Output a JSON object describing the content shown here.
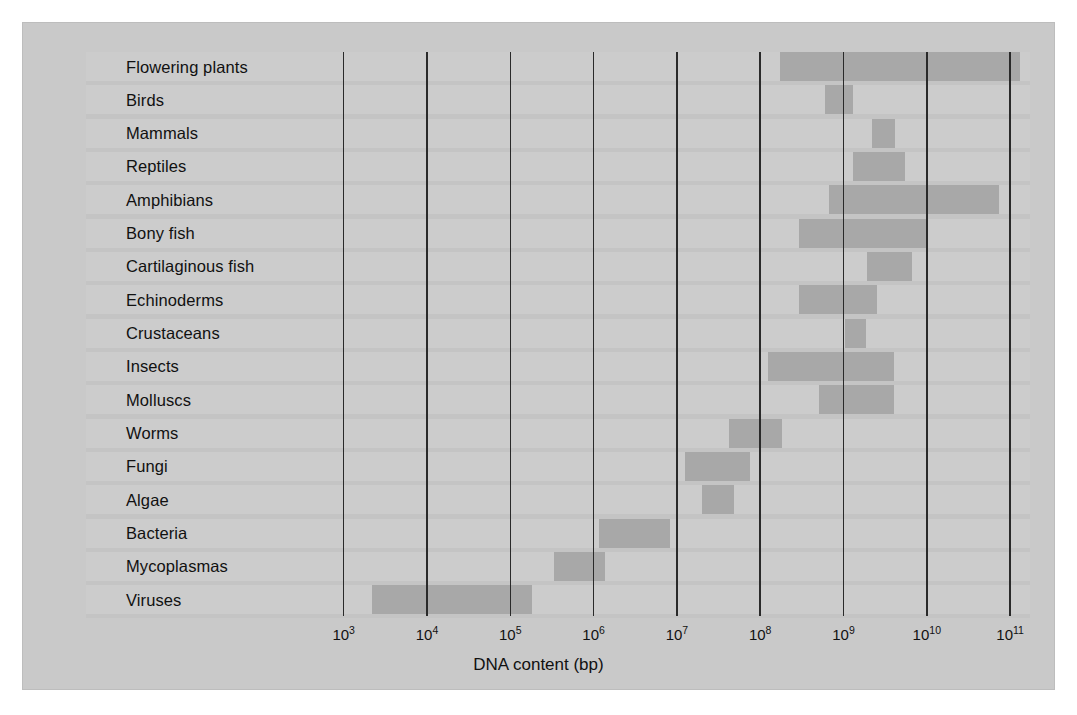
{
  "chart_data": {
    "type": "bar",
    "orientation": "horizontal",
    "title": "",
    "xlabel": "DNA content (bp)",
    "ylabel": "",
    "x_scale": "log10",
    "xlim": [
      3,
      11.35
    ],
    "grid": true,
    "legend": null,
    "x_ticks": [
      {
        "label": "10",
        "exponent": "3",
        "value": 3
      },
      {
        "label": "10",
        "exponent": "4",
        "value": 4
      },
      {
        "label": "10",
        "exponent": "5",
        "value": 5
      },
      {
        "label": "10",
        "exponent": "6",
        "value": 6
      },
      {
        "label": "10",
        "exponent": "7",
        "value": 7
      },
      {
        "label": "10",
        "exponent": "8",
        "value": 8
      },
      {
        "label": "10",
        "exponent": "9",
        "value": 9
      },
      {
        "label": "10",
        "exponent": "10",
        "value": 10
      },
      {
        "label": "10",
        "exponent": "11",
        "value": 11
      }
    ],
    "categories": [
      "Flowering plants",
      "Birds",
      "Mammals",
      "Reptiles",
      "Amphibians",
      "Bony fish",
      "Cartilaginous fish",
      "Echinoderms",
      "Crustaceans",
      "Insects",
      "Molluscs",
      "Worms",
      "Fungi",
      "Algae",
      "Bacteria",
      "Mycoplasmas",
      "Viruses"
    ],
    "ranges_log10": [
      [
        8.24,
        11.12
      ],
      [
        8.78,
        9.12
      ],
      [
        9.34,
        9.62
      ],
      [
        9.12,
        9.74
      ],
      [
        8.82,
        10.87
      ],
      [
        8.46,
        9.99
      ],
      [
        9.28,
        9.82
      ],
      [
        8.46,
        9.4
      ],
      [
        9.02,
        9.27
      ],
      [
        8.09,
        9.61
      ],
      [
        8.7,
        9.61
      ],
      [
        7.62,
        8.26
      ],
      [
        7.1,
        7.88
      ],
      [
        7.3,
        7.69
      ],
      [
        6.06,
        6.92
      ],
      [
        5.53,
        6.14
      ],
      [
        3.34,
        5.26
      ]
    ]
  },
  "colors": {
    "figure_background": "#c9c9c9",
    "row_background": "#cccccc",
    "bar_fill": "#a8a8a8",
    "gridline": "#2a2a2a",
    "text": "#111111",
    "page_background": "#ffffff"
  }
}
